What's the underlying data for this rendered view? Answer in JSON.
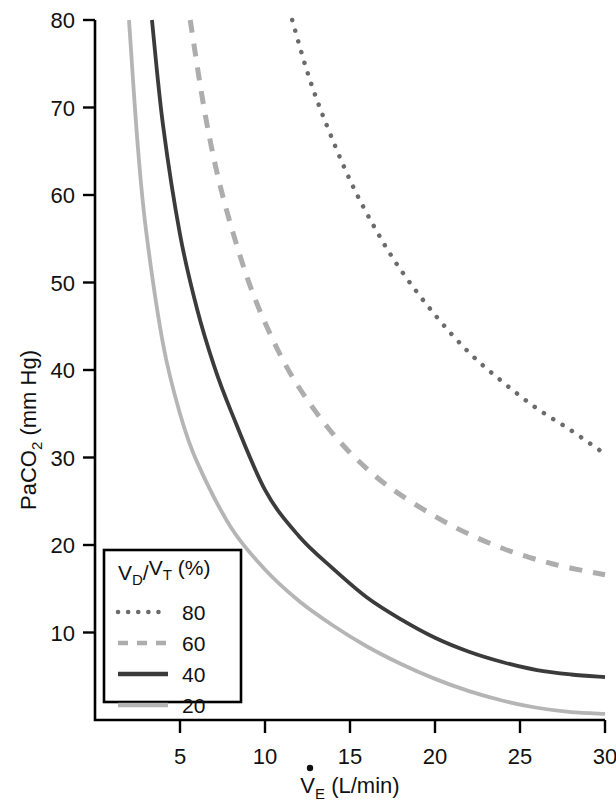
{
  "chart_data": {
    "type": "line",
    "title": "",
    "xlabel": "V̇E (L/min)",
    "ylabel": "PaCO2 (mm Hg)",
    "xlabel_parts": {
      "main": "V",
      "dot": "̇",
      "sub": "E",
      "unit": " (L/min)"
    },
    "ylabel_parts": {
      "main": "PaCO",
      "sub": "2",
      "unit": " (mm Hg)"
    },
    "xlim": [
      0,
      30
    ],
    "ylim": [
      0,
      80
    ],
    "xticks": [
      5,
      10,
      15,
      20,
      25,
      30
    ],
    "yticks": [
      10,
      20,
      30,
      40,
      50,
      60,
      70,
      80
    ],
    "xticklabels": [
      "5",
      "10",
      "15",
      "20",
      "25",
      "30"
    ],
    "yticklabels": [
      "10",
      "20",
      "30",
      "40",
      "50",
      "60",
      "70",
      "80"
    ],
    "grid": false,
    "legend_position": "bottom-left",
    "legend_title": "VD/VT (%)",
    "legend_title_parts": {
      "v1": "V",
      "sub1": "D",
      "slash": "/",
      "v2": "V",
      "sub2": "T",
      "unit": " (%)"
    },
    "series": [
      {
        "name": "80",
        "label": "80",
        "dash_style": "dotted",
        "color": "#6b6b6b",
        "width": 4.5,
        "k": 240,
        "points": [
          {
            "x": 11.6,
            "y": 80.0
          },
          {
            "x": 12.5,
            "y": 74.0
          },
          {
            "x": 13.5,
            "y": 68.6
          },
          {
            "x": 15.0,
            "y": 61.7
          },
          {
            "x": 16.5,
            "y": 56.1
          },
          {
            "x": 18.0,
            "y": 51.4
          },
          {
            "x": 20.0,
            "y": 46.3
          },
          {
            "x": 22.0,
            "y": 42.0
          },
          {
            "x": 24.0,
            "y": 38.6
          },
          {
            "x": 26.0,
            "y": 35.6
          },
          {
            "x": 28.0,
            "y": 33.1
          },
          {
            "x": 30.0,
            "y": 30.4
          }
        ]
      },
      {
        "name": "60",
        "label": "60",
        "dash_style": "dashed",
        "color": "#adadad",
        "width": 5,
        "k": 124,
        "points": [
          {
            "x": 5.6,
            "y": 80.0
          },
          {
            "x": 6.5,
            "y": 69.0
          },
          {
            "x": 7.5,
            "y": 60.0
          },
          {
            "x": 9.0,
            "y": 50.3
          },
          {
            "x": 10.5,
            "y": 43.3
          },
          {
            "x": 12.0,
            "y": 38.0
          },
          {
            "x": 14.0,
            "y": 32.7
          },
          {
            "x": 16.0,
            "y": 28.7
          },
          {
            "x": 18.0,
            "y": 25.7
          },
          {
            "x": 21.0,
            "y": 22.2
          },
          {
            "x": 24.0,
            "y": 19.6
          },
          {
            "x": 27.0,
            "y": 17.8
          },
          {
            "x": 30.0,
            "y": 16.6
          }
        ]
      },
      {
        "name": "40",
        "label": "40",
        "dash_style": "solid",
        "color": "#3b3b3b",
        "width": 3.8,
        "k": 190,
        "points": [
          {
            "x": 3.35,
            "y": 80.0
          },
          {
            "x": 4.0,
            "y": 68.0
          },
          {
            "x": 5.0,
            "y": 55.5
          },
          {
            "x": 6.0,
            "y": 47.0
          },
          {
            "x": 7.0,
            "y": 40.5
          },
          {
            "x": 8.0,
            "y": 35.3
          },
          {
            "x": 10.0,
            "y": 26.3
          },
          {
            "x": 12.0,
            "y": 21.0
          },
          {
            "x": 14.0,
            "y": 17.3
          },
          {
            "x": 16.0,
            "y": 14.0
          },
          {
            "x": 18.0,
            "y": 11.5
          },
          {
            "x": 20.0,
            "y": 9.4
          },
          {
            "x": 22.0,
            "y": 7.8
          },
          {
            "x": 24.0,
            "y": 6.6
          },
          {
            "x": 26.0,
            "y": 5.7
          },
          {
            "x": 28.0,
            "y": 5.2
          },
          {
            "x": 30.0,
            "y": 4.9
          }
        ]
      },
      {
        "name": "20",
        "label": "20",
        "dash_style": "solid",
        "color": "#b5b5b5",
        "width": 3.8,
        "k": 160,
        "points": [
          {
            "x": 2.0,
            "y": 80.0
          },
          {
            "x": 2.5,
            "y": 66.0
          },
          {
            "x": 3.0,
            "y": 56.0
          },
          {
            "x": 4.0,
            "y": 43.0
          },
          {
            "x": 5.0,
            "y": 35.0
          },
          {
            "x": 6.0,
            "y": 29.5
          },
          {
            "x": 8.0,
            "y": 22.0
          },
          {
            "x": 10.0,
            "y": 17.2
          },
          {
            "x": 12.0,
            "y": 13.6
          },
          {
            "x": 14.0,
            "y": 10.8
          },
          {
            "x": 16.0,
            "y": 8.4
          },
          {
            "x": 18.0,
            "y": 6.4
          },
          {
            "x": 20.0,
            "y": 4.7
          },
          {
            "x": 22.0,
            "y": 3.3
          },
          {
            "x": 24.0,
            "y": 2.2
          },
          {
            "x": 26.0,
            "y": 1.4
          },
          {
            "x": 28.0,
            "y": 0.9
          },
          {
            "x": 30.0,
            "y": 0.7
          }
        ]
      }
    ]
  },
  "legend": {
    "title": "VD/VT (%)",
    "entries": [
      {
        "label": "80",
        "style": "dotted"
      },
      {
        "label": "60",
        "style": "dashed"
      },
      {
        "label": "40",
        "style": "solid-dark"
      },
      {
        "label": "20",
        "style": "solid-light"
      }
    ]
  },
  "colors": {
    "axis": "#000000",
    "text": "#111111",
    "series_80": "#6b6b6b",
    "series_60": "#adadad",
    "series_40": "#3b3b3b",
    "series_20": "#b5b5b5"
  }
}
